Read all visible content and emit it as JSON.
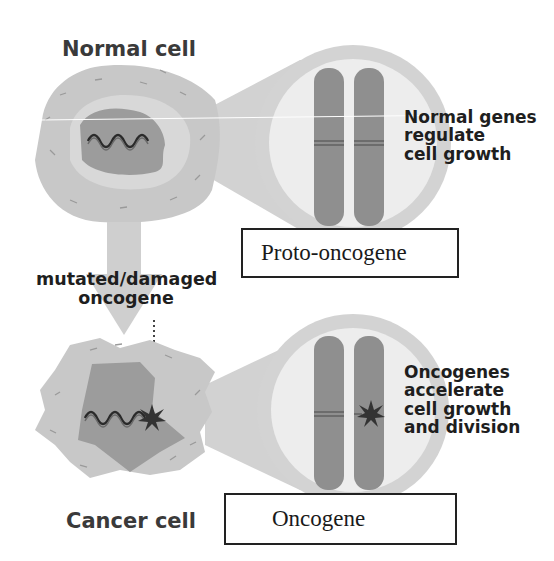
{
  "diagram": {
    "normal_cell": {
      "title": "Normal cell",
      "description_lines": [
        "Normal genes",
        "regulate",
        "cell growth"
      ],
      "gene_label": "Proto-oncogene"
    },
    "transition": {
      "label_lines": [
        "mutated/damaged",
        "oncogene"
      ]
    },
    "cancer_cell": {
      "title": "Cancer cell",
      "description_lines": [
        "Oncogenes",
        "accelerate",
        "cell growth",
        "and division"
      ],
      "gene_label": "Oncogene"
    },
    "colors": {
      "cytoplasm": "#c9c9c9",
      "cytoplasm_inner": "#d9d9d9",
      "nucleus": "#9a9a9a",
      "magnifier": "#d4d4d4",
      "lens_inner": "#ececec",
      "chromosome": "#8f8f8f",
      "mutation_star": "#333333",
      "dna": "#2e2e2e"
    }
  }
}
